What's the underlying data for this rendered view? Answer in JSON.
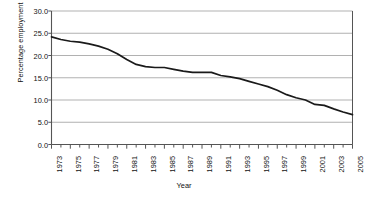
{
  "chart_data": {
    "type": "line",
    "title": "",
    "xlabel": "Year",
    "ylabel": "Percentage employment",
    "xlim": [
      1973,
      2005
    ],
    "ylim": [
      0.0,
      30.0
    ],
    "grid": true,
    "legend": false,
    "ytick_labels": [
      "30.0",
      "25.0",
      "20.0",
      "15.0",
      "10.0",
      "5.0",
      "0.0"
    ],
    "ytick_values": [
      30.0,
      25.0,
      20.0,
      15.0,
      10.0,
      5.0,
      0.0
    ],
    "xtick_labels": [
      "1973",
      "1975",
      "1977",
      "1979",
      "1981",
      "1983",
      "1985",
      "1987",
      "1989",
      "1991",
      "1993",
      "1995",
      "1997",
      "1999",
      "2001",
      "2003",
      "2005"
    ],
    "xtick_values": [
      1973,
      1975,
      1977,
      1979,
      1981,
      1983,
      1985,
      1987,
      1989,
      1991,
      1993,
      1995,
      1997,
      1999,
      2001,
      2003,
      2005
    ],
    "minor_tick_years": [
      1974,
      1976,
      1978,
      1980,
      1982,
      1984,
      1986,
      1988,
      1990,
      1992,
      1994,
      1996,
      1998,
      2000,
      2002,
      2004
    ],
    "line_color": "#1a1a1a",
    "grid_color": "#a8a8a8",
    "series": [
      {
        "name": "Percentage employment",
        "x": [
          1973,
          1974,
          1975,
          1976,
          1977,
          1978,
          1979,
          1980,
          1981,
          1982,
          1983,
          1984,
          1985,
          1986,
          1987,
          1988,
          1989,
          1990,
          1991,
          1992,
          1993,
          1994,
          1995,
          1996,
          1997,
          1998,
          1999,
          2000,
          2001,
          2002,
          2003,
          2004,
          2005
        ],
        "values": [
          24.2,
          23.6,
          23.2,
          23.0,
          22.6,
          22.1,
          21.4,
          20.4,
          19.1,
          18.0,
          17.5,
          17.3,
          17.3,
          16.9,
          16.5,
          16.2,
          16.2,
          16.2,
          15.5,
          15.2,
          14.8,
          14.2,
          13.6,
          13.0,
          12.2,
          11.2,
          10.5,
          10.0,
          9.0,
          8.8,
          8.0,
          7.3,
          6.7
        ]
      }
    ]
  }
}
